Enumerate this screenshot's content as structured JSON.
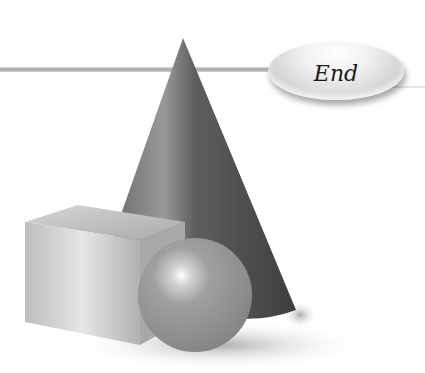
{
  "buttons": {
    "end_label": "End"
  },
  "scene": {
    "shapes": [
      "cone",
      "cube",
      "sphere"
    ]
  },
  "colors": {
    "background": "#ffffff",
    "line": "#b0b0b0",
    "button_light": "#f0f0f0",
    "button_dark": "#a9a9a9",
    "cone": "#555555",
    "cube": "#c8c8c8",
    "sphere": "#999999"
  }
}
